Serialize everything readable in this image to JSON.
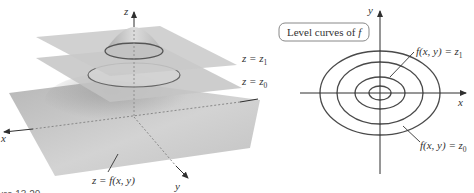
{
  "figure": {
    "caption_fragment": "ure 13.20",
    "surface_view": {
      "axes": {
        "x": "x",
        "y": "y",
        "z": "z"
      },
      "surface_label": "z = f(x, y)",
      "plane_labels": [
        {
          "name": "upper",
          "text": "z = ",
          "var": "z",
          "sub": "1"
        },
        {
          "name": "lower",
          "text": "z = ",
          "var": "z",
          "sub": "0"
        }
      ],
      "surface_label_parts": {
        "lhs": "z = ",
        "rhs": "f(x, y)"
      }
    },
    "level_curve_view": {
      "title": "Level curves of f",
      "title_parts": {
        "text": "Level curves of ",
        "var": "f"
      },
      "axes": {
        "x": "x",
        "y": "y"
      },
      "curve_labels": [
        {
          "name": "z1",
          "text": "f(x, y) = ",
          "var": "z",
          "sub": "1"
        },
        {
          "name": "z0",
          "text": "f(x, y) = ",
          "var": "z",
          "sub": "0"
        }
      ],
      "ellipses": [
        {
          "cx": 380,
          "cy": 93,
          "rx": 60,
          "ry": 42
        },
        {
          "cx": 380,
          "cy": 93,
          "rx": 43,
          "ry": 31
        },
        {
          "cx": 380,
          "cy": 93,
          "rx": 25,
          "ry": 16
        },
        {
          "cx": 380,
          "cy": 93,
          "rx": 11,
          "ry": 7
        }
      ]
    },
    "colors": {
      "plane_fill": "#c8c8c8",
      "plane_dark": "#9a9a9a",
      "curve_stroke": "#555555",
      "axis_stroke": "#3a3a3a",
      "label_box_stroke": "#888888"
    }
  }
}
